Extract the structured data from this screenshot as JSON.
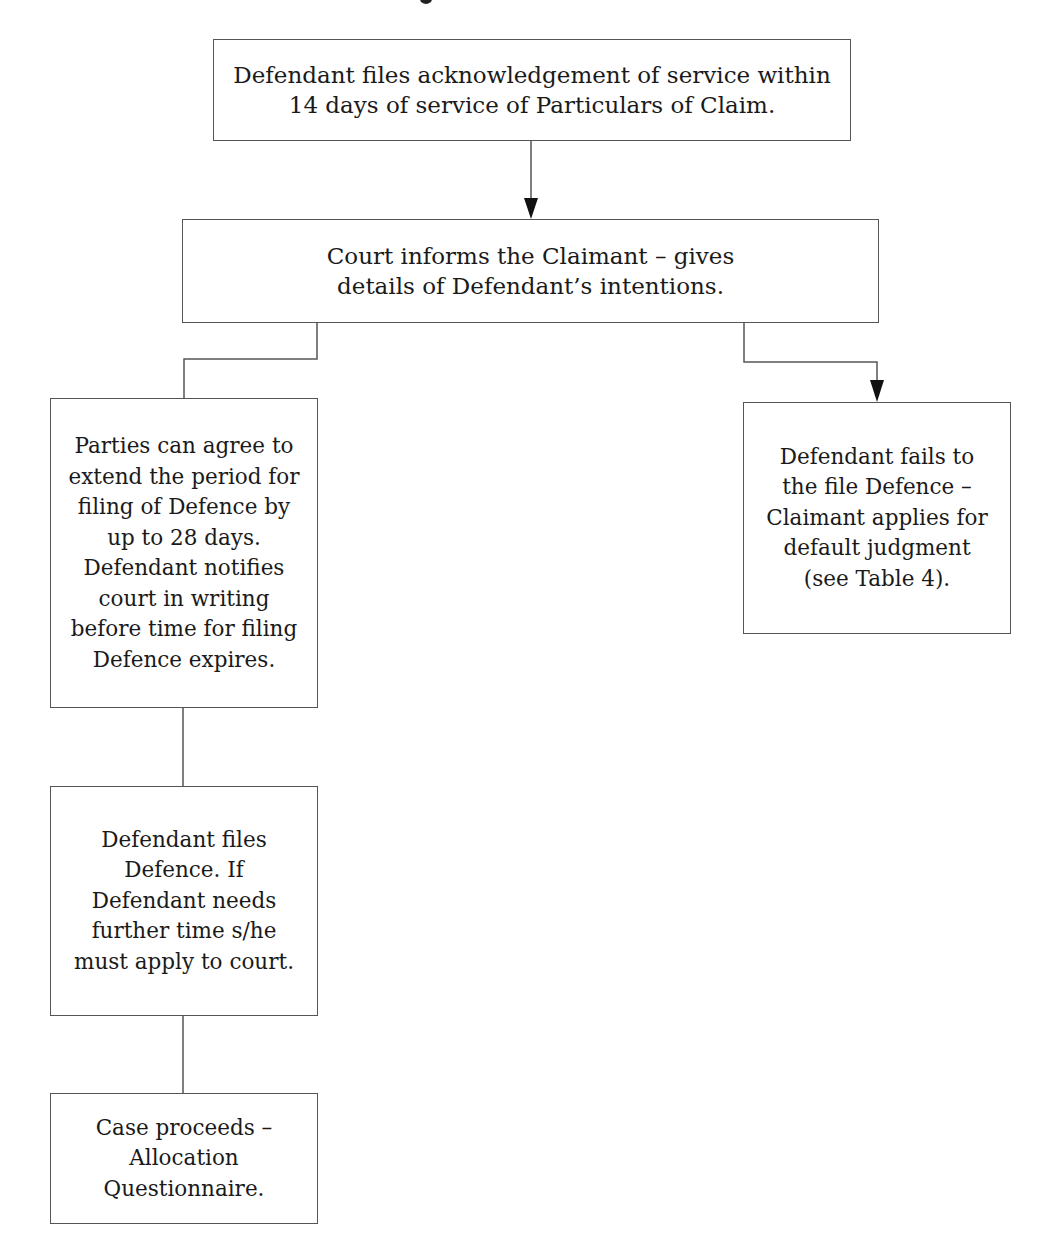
{
  "diagram": {
    "type": "flowchart",
    "nodes": [
      {
        "id": "acknowledgement",
        "label": "Defendant files acknowledgement of service within 14 days of service of Particulars of Claim."
      },
      {
        "id": "court-informs",
        "label": "Court informs the Claimant – gives details of Defendant’s intentions."
      },
      {
        "id": "extend-period",
        "label": "Parties can agree to extend the period for filing of Defence by up to 28 days. Defendant notifies court in writing before time for filing Defence expires."
      },
      {
        "id": "fails-to-file",
        "label": "Defendant fails to the file Defence – Claimant applies for default judgment (see Table 4)."
      },
      {
        "id": "files-defence",
        "label": "Defendant files Defence. If Defendant needs further time s/he must apply to court."
      },
      {
        "id": "case-proceeds",
        "label": "Case proceeds – Allocation Questionnaire."
      }
    ],
    "edges": [
      {
        "from": "acknowledgement",
        "to": "court-informs",
        "arrow": true
      },
      {
        "from": "court-informs",
        "to": "extend-period",
        "arrow": false
      },
      {
        "from": "court-informs",
        "to": "fails-to-file",
        "arrow": true
      },
      {
        "from": "extend-period",
        "to": "files-defence",
        "arrow": false
      },
      {
        "from": "files-defence",
        "to": "case-proceeds",
        "arrow": false
      }
    ],
    "colors": {
      "border": "#555555",
      "line": "#555555",
      "arrowhead": "#111111",
      "text": "#1a1a1a",
      "background": "#ffffff"
    }
  }
}
